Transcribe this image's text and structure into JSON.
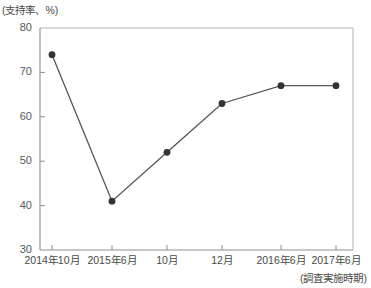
{
  "chart_data": {
    "type": "line",
    "title": "",
    "ylabel": "(支持率、%)",
    "xlabel": "(調査実施時期)",
    "categories": [
      "2014年10月",
      "2015年6月",
      "10月",
      "12月",
      "2016年6月",
      "2017年6月"
    ],
    "values": [
      74,
      41,
      52,
      63,
      67,
      67
    ],
    "ylim": [
      30,
      80
    ],
    "yticks": [
      "30",
      "40",
      "50",
      "60",
      "70",
      "80"
    ],
    "ytick_values": [
      30,
      40,
      50,
      60,
      70,
      80
    ],
    "grid": false,
    "legend": "none",
    "series": [
      {
        "name": "支持率",
        "values": [
          74,
          41,
          52,
          63,
          67,
          67
        ],
        "marker": "circle",
        "color": "#3c3c3c"
      }
    ],
    "colors": {
      "line": "#555555",
      "marker": "#333333",
      "axis": "#9a9a9a",
      "text": "#4a4a4a"
    }
  },
  "axes": {
    "y_title": "(支持率、%)",
    "x_title": "(調査実施時期)"
  }
}
